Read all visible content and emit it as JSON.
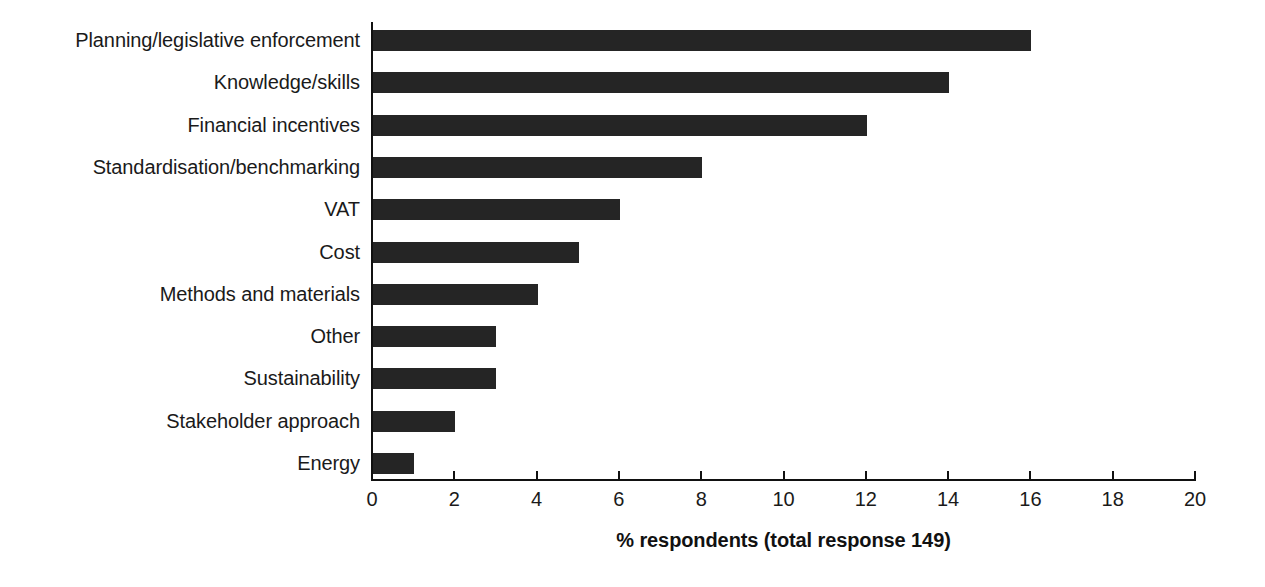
{
  "chart_data": {
    "type": "bar",
    "orientation": "horizontal",
    "title": "",
    "subtitle": "",
    "xlabel": "% respondents (total response 149)",
    "ylabel": "",
    "categories": [
      "Planning/legislative enforcement",
      "Knowledge/skills",
      "Financial incentives",
      "Standardisation/benchmarking",
      "VAT",
      "Cost",
      "Methods and materials",
      "Other",
      "Sustainability",
      "Stakeholder approach",
      "Energy"
    ],
    "values": [
      16,
      14,
      12,
      8,
      6,
      5,
      4,
      3,
      3,
      2,
      1
    ],
    "xlim": [
      0,
      20
    ],
    "xticks": [
      0,
      2,
      4,
      6,
      8,
      10,
      12,
      14,
      16,
      18,
      20
    ],
    "xtick_labels": [
      "0",
      "2",
      "4",
      "6",
      "8",
      "10",
      "12",
      "14",
      "16",
      "18",
      "20"
    ],
    "grid": false,
    "legend": null,
    "annotations": [],
    "total_response": 149,
    "bar_color": "#252525",
    "axis_color": "#111111",
    "background_color": "#ffffff"
  }
}
